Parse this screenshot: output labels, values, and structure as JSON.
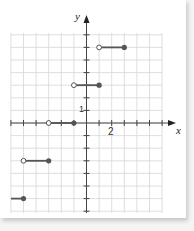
{
  "chart_data": {
    "type": "line",
    "title": "",
    "xlabel": "x",
    "ylabel": "y",
    "xlim": [
      -6,
      6
    ],
    "ylim": [
      -7,
      7
    ],
    "grid": true,
    "tick_labels": {
      "x": [
        "2"
      ],
      "y": [
        "1"
      ]
    },
    "segments": [
      {
        "y": 6,
        "x_start": 1,
        "x_end": 3,
        "start": "open",
        "end": "closed"
      },
      {
        "y": 3,
        "x_start": -1,
        "x_end": 1,
        "start": "open",
        "end": "closed"
      },
      {
        "y": 0,
        "x_start": -3,
        "x_end": -1,
        "start": "open",
        "end": "closed"
      },
      {
        "y": -3,
        "x_start": -5,
        "x_end": -3,
        "start": "open",
        "end": "closed"
      },
      {
        "y": -6,
        "x_start": -6,
        "x_end": -5,
        "start": "none",
        "end": "closed"
      }
    ],
    "colors": {
      "line": "#555555",
      "grid": "#d6d6d6",
      "axis": "#444444"
    }
  },
  "labels": {
    "x_axis": "x",
    "y_axis": "y",
    "x_tick": "2",
    "y_tick": "1"
  }
}
